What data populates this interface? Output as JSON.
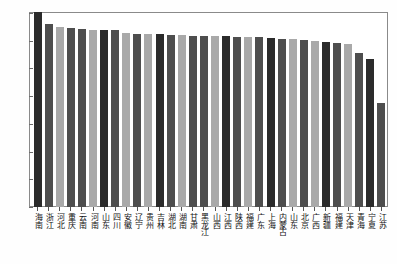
{
  "chart_data": {
    "type": "bar",
    "title": "",
    "subtitle": "",
    "xlabel": "",
    "ylabel": "",
    "ylim": [
      0,
      700
    ],
    "ytick_values": [
      0,
      100,
      200,
      300,
      400,
      500,
      600,
      700
    ],
    "ytick_labels": [
      "0",
      "100",
      "200",
      "300",
      "400",
      "500",
      "600",
      "700"
    ],
    "grid": false,
    "legend": "none",
    "bar_colors": [
      "#2b2b2b",
      "#4e4e4e",
      "#a9a9a9"
    ],
    "categories": [
      "海南",
      "浙江",
      "河北",
      "重庆",
      "云南",
      "河南",
      "山东",
      "四川",
      "安徽",
      "辽宁",
      "贵州",
      "吉林",
      "湖北",
      "湖南",
      "甘肃",
      "黑龙江",
      "山西",
      "江西",
      "陕西",
      "福建",
      "广东",
      "上海",
      "内蒙古",
      "山东",
      "北京",
      "广西",
      "新疆",
      "福建",
      "天津",
      "青海",
      "宁夏",
      "江苏"
    ],
    "values": [
      705,
      662,
      648,
      645,
      643,
      640,
      640,
      639,
      628,
      625,
      624,
      623,
      620,
      619,
      618,
      618,
      617,
      616,
      614,
      612,
      612,
      610,
      608,
      605,
      602,
      600,
      596,
      592,
      590,
      556,
      535,
      375
    ],
    "series": [
      {
        "name": "值",
        "values": [
          705,
          662,
          648,
          645,
          643,
          640,
          640,
          639,
          628,
          625,
          624,
          623,
          620,
          619,
          618,
          618,
          617,
          616,
          614,
          612,
          612,
          610,
          608,
          605,
          602,
          600,
          596,
          592,
          590,
          556,
          535,
          375
        ]
      }
    ],
    "bar_shades": [
      "#2b2b2b",
      "#4e4e4e",
      "#a9a9a9",
      "#4e4e4e",
      "#4e4e4e",
      "#a9a9a9",
      "#2b2b2b",
      "#4e4e4e",
      "#a9a9a9",
      "#4e4e4e",
      "#a9a9a9",
      "#2b2b2b",
      "#4e4e4e",
      "#a9a9a9",
      "#4e4e4e",
      "#4e4e4e",
      "#a9a9a9",
      "#2b2b2b",
      "#4e4e4e",
      "#a9a9a9",
      "#4e4e4e",
      "#2b2b2b",
      "#4e4e4e",
      "#a9a9a9",
      "#4e4e4e",
      "#a9a9a9",
      "#2b2b2b",
      "#4e4e4e",
      "#a9a9a9",
      "#4e4e4e",
      "#2b2b2b",
      "#4e4e4e"
    ]
  }
}
